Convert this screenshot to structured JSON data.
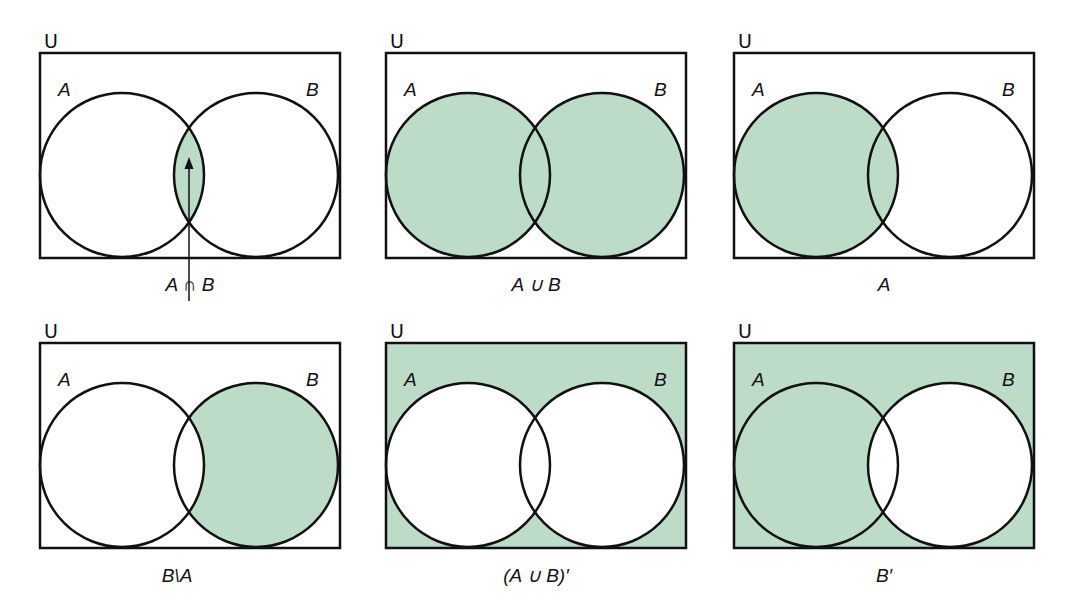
{
  "colors": {
    "shade": "#bcdcc8",
    "stroke": "#111111",
    "background": "#ffffff"
  },
  "universe_label": "U",
  "set_a_label": "A",
  "set_b_label": "B",
  "diagrams": [
    {
      "id": "intersection",
      "caption": "A ∩ B",
      "shaded": "A∩B",
      "has_arrow": true
    },
    {
      "id": "union",
      "caption": "A ∪ B",
      "shaded": "A∪B"
    },
    {
      "id": "set-a",
      "caption": "A",
      "shaded": "A"
    },
    {
      "id": "difference",
      "caption": "B\\A",
      "shaded": "B minus A"
    },
    {
      "id": "union-complement",
      "caption": "(A ∪ B)′",
      "shaded": "outside A∪B"
    },
    {
      "id": "b-complement",
      "caption": "B′",
      "shaded": "outside B"
    }
  ]
}
